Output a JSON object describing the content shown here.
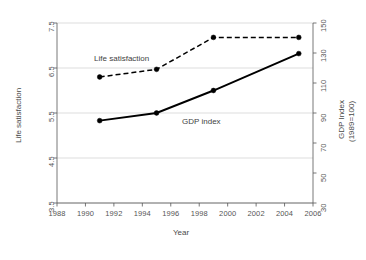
{
  "chart_data": {
    "type": "line",
    "title": "",
    "xlabel": "Year",
    "ylabel": "Life satisfaction",
    "y2label": "GDP Index\n(1989=100)",
    "y2label_line1": "GDP Index",
    "y2label_line2": "(1989=100)",
    "x": [
      1991,
      1995,
      1999,
      2005
    ],
    "xlim": [
      1988,
      2006
    ],
    "ylim": [
      3.5,
      7.5
    ],
    "y2lim": [
      30,
      150
    ],
    "xticks": [
      1988,
      1990,
      1992,
      1994,
      1996,
      1998,
      2000,
      2002,
      2004,
      2006
    ],
    "xtick_labels": [
      "1988",
      "1990",
      "1992",
      "1994",
      "1996",
      "1998",
      "2000",
      "2002",
      "2004",
      "2006"
    ],
    "yticks": [
      3.5,
      4.5,
      5.5,
      6.5,
      7.5
    ],
    "ytick_labels": [
      "3.5",
      "4.5",
      "5.5",
      "6.5",
      "7.5"
    ],
    "y2ticks": [
      30,
      50,
      70,
      90,
      110,
      130,
      150
    ],
    "y2tick_labels": [
      "30",
      "50",
      "70",
      "90",
      "110",
      "130",
      "150"
    ],
    "grid": true,
    "grid_axis": "y",
    "legend": "inline-annotations",
    "series": [
      {
        "name": "Life satisfaction",
        "axis": "left",
        "style": "dashed",
        "marker": "filled-circle",
        "color": "#000000",
        "values": [
          6.3,
          6.47,
          7.18,
          7.18
        ],
        "label_x": 1993.0,
        "label_y": 6.7
      },
      {
        "name": "GDP index",
        "axis": "right",
        "style": "solid",
        "marker": "filled-circle",
        "color": "#000000",
        "values": [
          84,
          89,
          104,
          129
        ],
        "values_left_scale": [
          5.33,
          5.5,
          6.0,
          6.82
        ],
        "label_x": 1998.2,
        "label_y": 5.3
      }
    ]
  },
  "annotations": {
    "life_satisfaction_label": "Life satisfaction",
    "gdp_index_label": "GDP index"
  }
}
